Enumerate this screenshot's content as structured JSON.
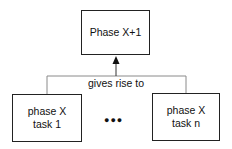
{
  "diagram": {
    "top_box": {
      "label": "Phase X+1"
    },
    "connector_label": "gives rise to",
    "bottom_boxes": [
      {
        "line1": "phase X",
        "line2": "task 1"
      },
      {
        "line1": "phase X",
        "line2": "task n"
      }
    ],
    "ellipsis": "●●●",
    "colors": {
      "stroke": "#222222",
      "connector": "#888888",
      "background": "#ffffff"
    }
  }
}
